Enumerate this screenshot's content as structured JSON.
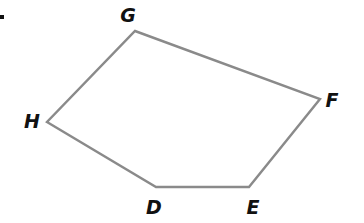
{
  "figure": {
    "type": "polygon",
    "marker": ".",
    "stroke_color": "#8a8a8a",
    "label_color": "#111111",
    "vertices": [
      {
        "name": "G",
        "x": 135,
        "y": 31,
        "label_x": 128,
        "label_y": 16
      },
      {
        "name": "F",
        "x": 320,
        "y": 99,
        "label_x": 332,
        "label_y": 101
      },
      {
        "name": "E",
        "x": 249,
        "y": 187,
        "label_x": 253,
        "label_y": 208
      },
      {
        "name": "D",
        "x": 156,
        "y": 187,
        "label_x": 154,
        "label_y": 208
      },
      {
        "name": "H",
        "x": 47,
        "y": 122,
        "label_x": 32,
        "label_y": 122
      }
    ],
    "edges": [
      [
        "G",
        "F"
      ],
      [
        "F",
        "E"
      ],
      [
        "E",
        "D"
      ],
      [
        "D",
        "H"
      ],
      [
        "H",
        "G"
      ]
    ]
  }
}
